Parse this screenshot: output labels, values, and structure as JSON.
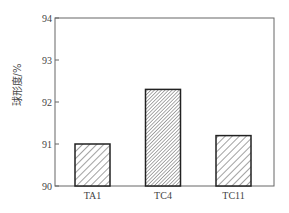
{
  "chart_data": {
    "type": "bar",
    "title": "",
    "xlabel": "",
    "ylabel": "球形度/%",
    "categories": [
      "TA1",
      "TC4",
      "TC11"
    ],
    "values": [
      91.0,
      92.3,
      91.2
    ],
    "ylim": [
      90,
      94
    ],
    "yticks": [
      90,
      91,
      92,
      93,
      94
    ],
    "grid": false,
    "legend": null,
    "bar_patterns": [
      "sparse-diagonal-hatch",
      "dense-diagonal-hatch",
      "sparse-diagonal-hatch"
    ],
    "colors": {
      "frame": "#555555",
      "bar_edge": "#222222",
      "hatch": "#444444",
      "background": "#ffffff"
    }
  }
}
